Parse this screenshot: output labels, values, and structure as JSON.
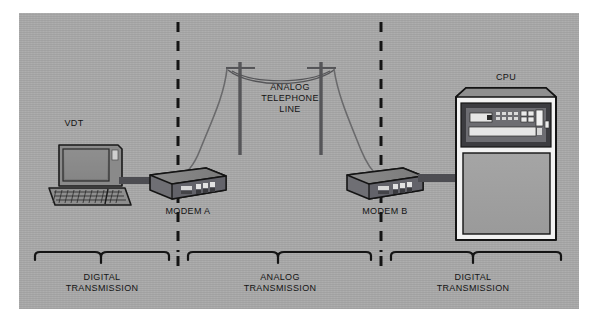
{
  "diagram": {
    "background_color": "#aaaaaa",
    "text_color": "#141414",
    "labels": {
      "vdt": "VDT",
      "modem_a": "MODEM A",
      "modem_b": "MODEM B",
      "cpu": "CPU",
      "analog_line": "ANALOG\nTELEPHONE\nLINE"
    },
    "zones": [
      {
        "id": "zone-digital-left",
        "label": "DIGITAL\nTRANSMISSION"
      },
      {
        "id": "zone-analog",
        "label": "ANALOG\nTRANSMISSION"
      },
      {
        "id": "zone-digital-right",
        "label": "DIGITAL\nTRANSMISSION"
      }
    ],
    "dividers": [
      {
        "id": "divider-left",
        "x": 178
      },
      {
        "id": "divider-right",
        "x": 381
      }
    ],
    "nodes": [
      {
        "id": "vdt",
        "type": "video-display-terminal"
      },
      {
        "id": "modem-a",
        "type": "modem"
      },
      {
        "id": "pole-a",
        "type": "telephone-pole"
      },
      {
        "id": "pole-b",
        "type": "telephone-pole"
      },
      {
        "id": "modem-b",
        "type": "modem"
      },
      {
        "id": "cpu",
        "type": "mainframe-cabinet"
      }
    ],
    "links": [
      {
        "id": "link-vdt-modem-a",
        "from": "vdt",
        "to": "modem-a",
        "signal": "digital"
      },
      {
        "id": "link-modem-a-pole-a",
        "from": "modem-a",
        "to": "pole-a",
        "signal": "analog"
      },
      {
        "id": "link-pole-a-pole-b",
        "from": "pole-a",
        "to": "pole-b",
        "signal": "analog"
      },
      {
        "id": "link-pole-b-modem-b",
        "from": "pole-b",
        "to": "modem-b",
        "signal": "analog"
      },
      {
        "id": "link-modem-b-cpu",
        "from": "modem-b",
        "to": "cpu",
        "signal": "digital"
      }
    ]
  }
}
